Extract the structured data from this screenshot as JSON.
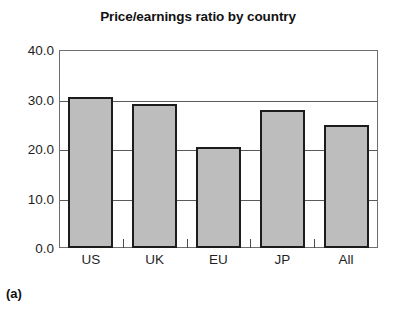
{
  "chart_data": {
    "type": "bar",
    "title": "Price/earnings ratio by country",
    "xlabel": "",
    "ylabel": "",
    "categories": [
      "US",
      "UK",
      "EU",
      "JP",
      "All"
    ],
    "values": [
      30.5,
      29.1,
      20.4,
      27.9,
      24.8
    ],
    "ylim": [
      0.0,
      40.0
    ],
    "yticks": [
      0.0,
      10.0,
      20.0,
      30.0,
      40.0
    ],
    "ytick_labels": [
      "0.0",
      "10.0",
      "20.0",
      "30.0",
      "40.0"
    ],
    "grid": true,
    "grid_axis": "y",
    "legend": false,
    "legend_position": "none",
    "bar_fill_color": "#bdbdbd",
    "bar_edge_color": "#1c1c1c",
    "frame_color": "#6e6e6e"
  },
  "caption": {
    "label": "(a)"
  }
}
